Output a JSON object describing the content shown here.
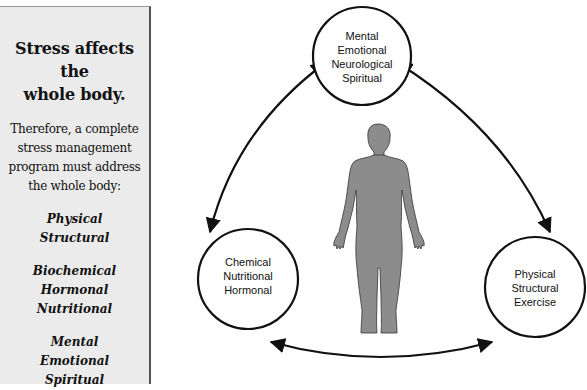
{
  "sidebar": {
    "title_line1": "Stress affects the",
    "title_line2": "whole body.",
    "lead_lines": [
      "Therefore, a complete",
      "stress management",
      "program must address",
      "the whole body:"
    ],
    "groups": [
      [
        "Physical",
        "Structural"
      ],
      [
        "Biochemical",
        "Hormonal",
        "Nutritional"
      ],
      [
        "Mental",
        "Emotional",
        "Spiritual"
      ]
    ]
  },
  "diagram": {
    "nodes": [
      {
        "id": "top",
        "lines": [
          "Mental",
          "Emotional",
          "Neurological",
          "Spiritual"
        ]
      },
      {
        "id": "bottom_left",
        "lines": [
          "Chemical",
          "Nutritional",
          "Hormonal"
        ]
      },
      {
        "id": "bottom_right",
        "lines": [
          "Physical",
          "Structural",
          "Exercise"
        ]
      }
    ],
    "edges": [
      {
        "from": "top",
        "to": "bottom_left",
        "bidirectional": true
      },
      {
        "from": "top",
        "to": "bottom_right",
        "bidirectional": true
      },
      {
        "from": "bottom_left",
        "to": "bottom_right",
        "bidirectional": true
      }
    ],
    "center_figure": "human-body-silhouette",
    "colors": {
      "stroke": "#111111",
      "figure_fill": "#8c8c8c",
      "panel_bg": "#ebebeb"
    }
  }
}
